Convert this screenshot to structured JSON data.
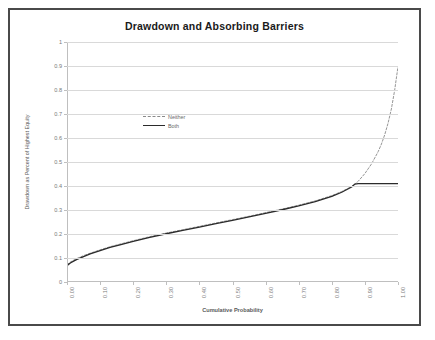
{
  "chart_data": {
    "type": "line",
    "title": "Drawdown and Absorbing Barriers",
    "xlabel": "Cumulative Probability",
    "ylabel": "Drawdown as Percent of Highest Equity",
    "xlim": [
      0,
      1
    ],
    "ylim": [
      0,
      1
    ],
    "grid": "horizontal",
    "legend_position": "upper-left-inside",
    "xticks": [
      "0.00",
      "0.10",
      "0.20",
      "0.30",
      "0.40",
      "0.50",
      "0.60",
      "0.70",
      "0.80",
      "0.90",
      "1.00"
    ],
    "yticks": [
      "0",
      "0.1",
      "0.2",
      "0.3",
      "0.4",
      "0.5",
      "0.6",
      "0.7",
      "0.8",
      "0.9",
      "1"
    ],
    "x": [
      0.0,
      0.01,
      0.02,
      0.03,
      0.05,
      0.07,
      0.1,
      0.13,
      0.16,
      0.2,
      0.25,
      0.3,
      0.35,
      0.4,
      0.45,
      0.5,
      0.55,
      0.6,
      0.65,
      0.7,
      0.75,
      0.8,
      0.83,
      0.86,
      0.87,
      0.88,
      0.9,
      0.92,
      0.94,
      0.95,
      0.96,
      0.97,
      0.98,
      0.99,
      1.0
    ],
    "series": [
      {
        "name": "Neither",
        "style": "dashed",
        "color": "#8a8a8a",
        "values": [
          0.072,
          0.083,
          0.091,
          0.098,
          0.11,
          0.12,
          0.134,
          0.147,
          0.158,
          0.172,
          0.189,
          0.204,
          0.218,
          0.232,
          0.246,
          0.26,
          0.274,
          0.289,
          0.304,
          0.32,
          0.338,
          0.36,
          0.377,
          0.398,
          0.408,
          0.42,
          0.452,
          0.492,
          0.543,
          0.575,
          0.614,
          0.662,
          0.721,
          0.8,
          0.898
        ]
      },
      {
        "name": "Both",
        "style": "solid",
        "color": "#2b2b2b",
        "values": [
          0.068,
          0.079,
          0.087,
          0.094,
          0.106,
          0.117,
          0.131,
          0.144,
          0.155,
          0.169,
          0.186,
          0.201,
          0.215,
          0.229,
          0.243,
          0.257,
          0.271,
          0.286,
          0.301,
          0.317,
          0.335,
          0.357,
          0.374,
          0.396,
          0.408,
          0.41,
          0.41,
          0.41,
          0.41,
          0.41,
          0.41,
          0.41,
          0.41,
          0.41,
          0.41
        ]
      }
    ]
  },
  "legend": {
    "items": [
      {
        "label": "Neither"
      },
      {
        "label": "Both"
      }
    ]
  }
}
